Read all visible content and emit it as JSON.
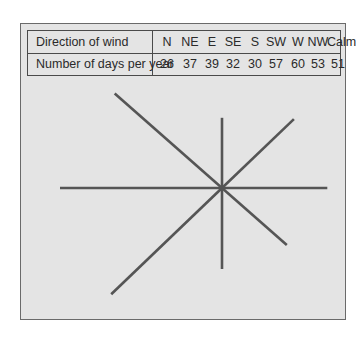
{
  "table": {
    "row_headers": [
      "Direction of wind",
      "Number of days per year"
    ],
    "directions": [
      "N",
      "NE",
      "E",
      "SE",
      "S",
      "SW",
      "W",
      "NW",
      "Calm"
    ],
    "days": [
      "26",
      "37",
      "39",
      "32",
      "30",
      "57",
      "60",
      "53",
      "51"
    ]
  },
  "chart_data": {
    "type": "table",
    "title": "",
    "subtype": "wind-rose (star diagram)",
    "categories": [
      "N",
      "NE",
      "E",
      "SE",
      "S",
      "SW",
      "W",
      "NW",
      "Calm"
    ],
    "values": [
      26,
      37,
      39,
      32,
      30,
      57,
      60,
      53,
      51
    ],
    "xlabel": "Direction of wind",
    "ylabel": "Number of days per year",
    "line_color": "#555555",
    "note": "Eight radial lines from a common centre, each length proportional to days per year for that direction; Calm not drawn."
  }
}
